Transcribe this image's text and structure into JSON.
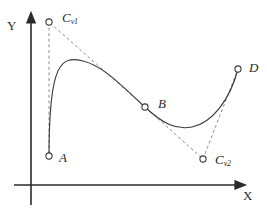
{
  "figure": {
    "title": "",
    "axes": {
      "x_label": "X",
      "y_label": "Y",
      "origin": [
        31,
        185
      ],
      "x_axis_end": [
        240,
        185
      ],
      "y_axis_end": [
        31,
        17
      ],
      "arrowheads": true,
      "grid": false
    },
    "points": [
      {
        "id": "A",
        "label": "A",
        "sub": "",
        "x": 49,
        "y": 156,
        "marker": "open-circle",
        "kind": "endpoint"
      },
      {
        "id": "B",
        "label": "B",
        "sub": "",
        "x": 145,
        "y": 107,
        "marker": "open-circle",
        "kind": "on-curve"
      },
      {
        "id": "D",
        "label": "D",
        "sub": "",
        "x": 238,
        "y": 69,
        "marker": "open-circle",
        "kind": "endpoint"
      },
      {
        "id": "Cv1",
        "label": "C",
        "sub": "v1",
        "x": 49,
        "y": 22,
        "marker": "open-circle",
        "kind": "control"
      },
      {
        "id": "Cv2",
        "label": "C",
        "sub": "v2",
        "x": 203,
        "y": 159,
        "marker": "open-circle",
        "kind": "control"
      }
    ],
    "dashed_lines": [
      {
        "from": "Cv1",
        "to": "A",
        "style": "dashed"
      },
      {
        "from": "Cv1",
        "to": "B",
        "style": "dashed"
      },
      {
        "from": "B",
        "to": "Cv2",
        "style": "dashed"
      },
      {
        "from": "Cv2",
        "to": "D",
        "style": "dashed"
      }
    ],
    "curve": {
      "style": "solid",
      "segments": [
        {
          "from": "A",
          "to": "B",
          "control_1": [
            49,
            22
          ],
          "control_2": [
            118,
            46
          ]
        },
        {
          "from": "B",
          "to": "D",
          "control_1": [
            172,
            124
          ],
          "control_2": [
            203,
            159
          ]
        }
      ],
      "peak": [
        83,
        61
      ],
      "valley": [
        190,
        127
      ]
    },
    "colors": {
      "stroke": "#3a3a3a",
      "axis": "#2b2b2b",
      "dash": "#8a8a8a",
      "marker_fill": "#ffffff",
      "background": "#ffffff"
    }
  }
}
